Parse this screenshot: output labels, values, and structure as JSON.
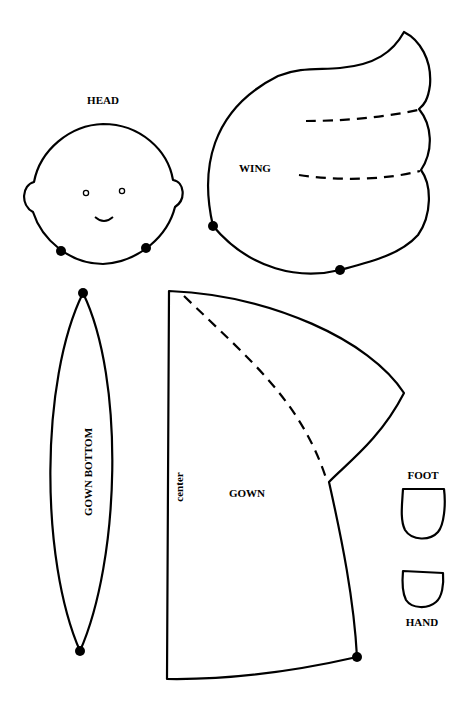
{
  "colors": {
    "background": "#ffffff",
    "line": "#000000"
  },
  "pieces": {
    "head": {
      "label": "HEAD",
      "marks": 2
    },
    "wing": {
      "label": "WING",
      "marks": 2,
      "fold_lines": 2
    },
    "gown_bottom": {
      "label": "GOWN BOTTOM",
      "marks": 2
    },
    "gown": {
      "label": "GOWN",
      "edge_label": "center",
      "marks": 1,
      "fold_lines": 1
    },
    "foot": {
      "label": "FOOT"
    },
    "hand": {
      "label": "HAND"
    }
  }
}
